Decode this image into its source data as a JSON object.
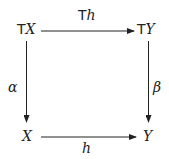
{
  "diagram": {
    "type": "commutative-square",
    "nodes": {
      "top_left": {
        "functor": "T",
        "object": "X"
      },
      "top_right": {
        "functor": "T",
        "object": "Y"
      },
      "bottom_left": {
        "object": "X"
      },
      "bottom_right": {
        "object": "Y"
      }
    },
    "arrows": {
      "top": {
        "functor": "T",
        "morphism": "h",
        "from": "TX",
        "to": "TY"
      },
      "left": {
        "label": "α",
        "from": "TX",
        "to": "X"
      },
      "right": {
        "label": "β",
        "from": "TY",
        "to": "Y"
      },
      "bottom": {
        "label": "h",
        "from": "X",
        "to": "Y"
      }
    },
    "colors": {
      "stroke": "#222222",
      "background": "#ffffff"
    }
  }
}
